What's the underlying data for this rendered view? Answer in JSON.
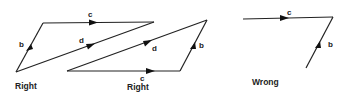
{
  "diagram": {
    "figures": [
      {
        "id": "fig1",
        "caption": "Right",
        "vectors": [
          {
            "label": "b",
            "from": [
              16,
              72
            ],
            "to": [
              43,
              23
            ]
          },
          {
            "label": "c",
            "from": [
              43,
              23
            ],
            "to": [
              154,
              22
            ]
          },
          {
            "label": "d",
            "from": [
              16,
              72
            ],
            "to": [
              154,
              22
            ]
          }
        ]
      },
      {
        "id": "fig2",
        "caption": "Right",
        "vectors": [
          {
            "label": "c",
            "from": [
              67,
              71
            ],
            "to": [
              180,
              71
            ]
          },
          {
            "label": "b",
            "from": [
              180,
              71
            ],
            "to": [
              207,
              20
            ]
          },
          {
            "label": "d",
            "from": [
              67,
              71
            ],
            "to": [
              207,
              20
            ]
          }
        ]
      },
      {
        "id": "fig3",
        "caption": "Wrong",
        "vectors": [
          {
            "label": "c",
            "from": [
              243,
              19
            ],
            "to": [
              333,
              17
            ]
          },
          {
            "label": "b",
            "from": [
              306,
              68
            ],
            "to": [
              333,
              17
            ]
          }
        ]
      }
    ],
    "labels": {
      "fig1_b": "b",
      "fig1_c": "c",
      "fig1_d": "d",
      "fig1_caption": "Right",
      "fig2_b": "b",
      "fig2_c": "c",
      "fig2_d": "d",
      "fig2_caption": "Right",
      "fig3_b": "b",
      "fig3_c": "c",
      "fig3_caption": "Wrong"
    }
  }
}
